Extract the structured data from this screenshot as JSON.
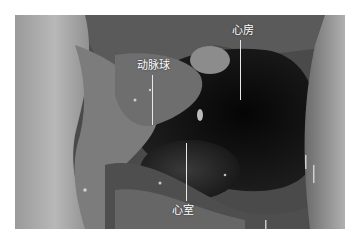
{
  "figure": {
    "labels": [
      {
        "id": "conus",
        "text": "动脉球"
      },
      {
        "id": "atrium",
        "text": "心房"
      },
      {
        "id": "ventricle",
        "text": "心室"
      }
    ]
  }
}
